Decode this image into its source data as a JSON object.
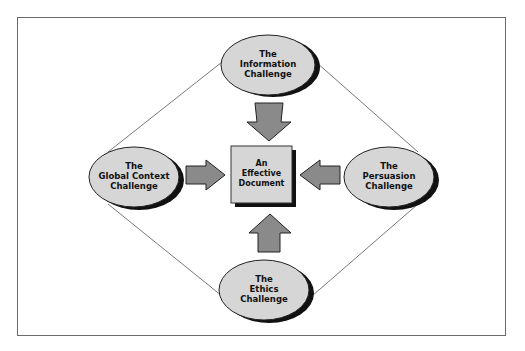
{
  "diagram": {
    "center": {
      "label_lines": [
        "An",
        "Effective",
        "Document"
      ]
    },
    "nodes": {
      "top": {
        "label_lines": [
          "The",
          "Information",
          "Challenge"
        ]
      },
      "left": {
        "label_lines": [
          "The",
          "Global Context",
          "Challenge"
        ]
      },
      "right": {
        "label_lines": [
          "The",
          "Persuasion",
          "Challenge"
        ]
      },
      "bottom": {
        "label_lines": [
          "The",
          "Ethics",
          "Challenge"
        ]
      }
    },
    "colors": {
      "fill": "#d6d6d6",
      "shadow": "#111111",
      "arrow": "#8a8a8a",
      "frame": "#6a6a6a",
      "line": "#555555"
    }
  }
}
